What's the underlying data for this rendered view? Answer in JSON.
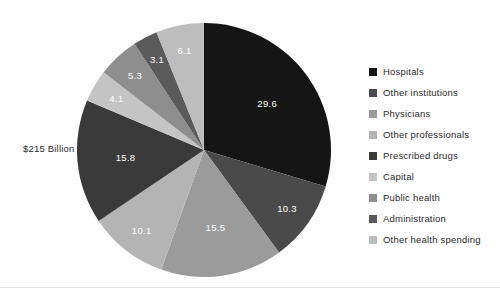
{
  "chart_data": {
    "type": "pie",
    "title": "",
    "annotation": "$215 Billion",
    "legend_position": "right",
    "grid": false,
    "start_angle_deg": 0,
    "direction": "clockwise",
    "categories": [
      "Hospitals",
      "Other institutions",
      "Physicians",
      "Other professionals",
      "Prescribed drugs",
      "Capital",
      "Public health",
      "Administration",
      "Other health spending"
    ],
    "values": [
      29.6,
      10.3,
      15.5,
      10.1,
      15.8,
      4.1,
      5.3,
      3.1,
      6.1
    ],
    "value_labels": [
      "29.6",
      "10.3",
      "15.5",
      "10.1",
      "15.8",
      "4.1",
      "5.3",
      "3.1",
      "6.1"
    ],
    "colors": [
      "#151515",
      "#4a4a4a",
      "#9b9b9b",
      "#b4b4b4",
      "#3a3a3a",
      "#c4c4c4",
      "#8e8e8e",
      "#5a5a5a",
      "#bdbdbd"
    ],
    "label_text_colors": [
      "#ffffff",
      "#ffffff",
      "#ffffff",
      "#ffffff",
      "#ffffff",
      "#ffffff",
      "#ffffff",
      "#ffffff",
      "#ffffff"
    ],
    "units": "percent"
  },
  "legend": {
    "items": [
      {
        "label": "Hospitals",
        "color": "#151515"
      },
      {
        "label": "Other institutions",
        "color": "#4a4a4a"
      },
      {
        "label": "Physicians",
        "color": "#9b9b9b"
      },
      {
        "label": "Other professionals",
        "color": "#b4b4b4"
      },
      {
        "label": "Prescribed drugs",
        "color": "#3a3a3a"
      },
      {
        "label": "Capital",
        "color": "#c4c4c4"
      },
      {
        "label": "Public health",
        "color": "#8e8e8e"
      },
      {
        "label": "Administration",
        "color": "#5a5a5a"
      },
      {
        "label": "Other health spending",
        "color": "#bdbdbd"
      }
    ]
  }
}
